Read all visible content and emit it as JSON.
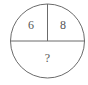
{
  "diagram": {
    "shape": "circle",
    "stroke_color": "#6b6b6b",
    "text_color": "#555555",
    "sections": [
      {
        "position": "top-left",
        "value": "6"
      },
      {
        "position": "top-right",
        "value": "8"
      },
      {
        "position": "bottom",
        "value": "?"
      }
    ]
  }
}
